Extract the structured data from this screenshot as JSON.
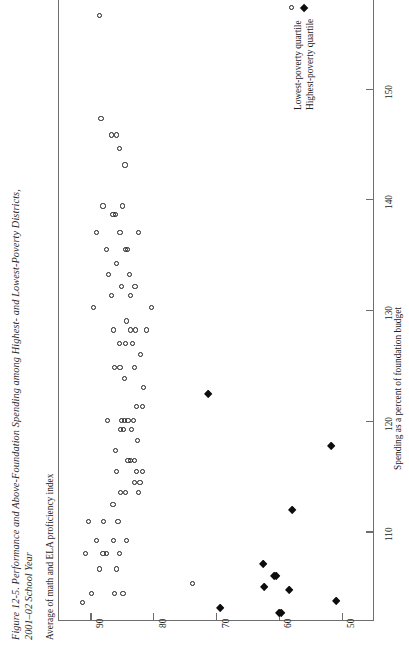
{
  "figure": {
    "title_line1": "Figure 12-5.  Performance and Above-Foundation Spending among Highest- and Lowest-Poverty Districts,",
    "title_line2": "2001–02 School Year"
  },
  "legend": {
    "position": "top-right",
    "items": [
      {
        "marker": "open-circle-marker",
        "label": "Lowest-poverty quartile"
      },
      {
        "marker": "filled-diamond-marker",
        "label": "Highest-poverty quartile"
      }
    ]
  },
  "chart_data": {
    "type": "scatter",
    "title": "Figure 12-5.  Performance and Above-Foundation Spending among Highest- and Lowest-Poverty Districts, 2001–02 School Year",
    "orientation": "rotated-90-ccw",
    "xlabel": "Spending as a percent of foundation budget",
    "ylabel": "Average of math and ELA proficiency index",
    "xlim": [
      102,
      158
    ],
    "ylim": [
      45,
      95
    ],
    "xticks": [
      110,
      120,
      130,
      140,
      150
    ],
    "yticks": [
      90,
      80,
      70,
      60,
      50
    ],
    "grid": false,
    "series": [
      {
        "name": "Lowest-poverty quartile",
        "marker": "open-circle",
        "points": [
          [
            156.6,
            88.5
          ],
          [
            147.3,
            88.3
          ],
          [
            145.8,
            86.6
          ],
          [
            145.8,
            85.9
          ],
          [
            144.6,
            85.4
          ],
          [
            143.1,
            84.5
          ],
          [
            139.4,
            88.0
          ],
          [
            139.4,
            84.9
          ],
          [
            138.6,
            86.4
          ],
          [
            138.6,
            86.0
          ],
          [
            137.0,
            89.0
          ],
          [
            137.0,
            85.3
          ],
          [
            137.0,
            82.3
          ],
          [
            135.5,
            87.5
          ],
          [
            135.5,
            84.4
          ],
          [
            135.5,
            84.1
          ],
          [
            134.2,
            85.8
          ],
          [
            133.2,
            87.1
          ],
          [
            133.2,
            83.8
          ],
          [
            132.1,
            85.0
          ],
          [
            132.1,
            82.9
          ],
          [
            131.3,
            86.7
          ],
          [
            131.3,
            83.6
          ],
          [
            130.2,
            89.5
          ],
          [
            130.2,
            80.3
          ],
          [
            129.0,
            84.2
          ],
          [
            128.2,
            86.3
          ],
          [
            128.2,
            83.6
          ],
          [
            128.2,
            82.8
          ],
          [
            128.2,
            81.1
          ],
          [
            127.0,
            85.4
          ],
          [
            127.0,
            84.4
          ],
          [
            127.0,
            83.3
          ],
          [
            126.0,
            82.0
          ],
          [
            124.8,
            86.1
          ],
          [
            124.8,
            85.3
          ],
          [
            124.8,
            83.0
          ],
          [
            123.8,
            84.6
          ],
          [
            123.0,
            81.5
          ],
          [
            121.3,
            82.6
          ],
          [
            121.3,
            81.7
          ],
          [
            120.0,
            87.3
          ],
          [
            120.0,
            85.0
          ],
          [
            120.0,
            84.6
          ],
          [
            120.0,
            84.0
          ],
          [
            120.0,
            83.2
          ],
          [
            119.2,
            85.2
          ],
          [
            119.2,
            84.7
          ],
          [
            119.2,
            83.5
          ],
          [
            118.2,
            82.5
          ],
          [
            117.3,
            86.0
          ],
          [
            116.4,
            84.0
          ],
          [
            116.4,
            83.6
          ],
          [
            116.4,
            83.0
          ],
          [
            115.4,
            85.8
          ],
          [
            115.4,
            82.6
          ],
          [
            115.4,
            81.7
          ],
          [
            114.4,
            83.0
          ],
          [
            114.4,
            82.1
          ],
          [
            113.5,
            85.2
          ],
          [
            113.5,
            84.4
          ],
          [
            113.5,
            82.4
          ],
          [
            112.4,
            86.4
          ],
          [
            110.9,
            90.3
          ],
          [
            110.9,
            87.9
          ],
          [
            110.9,
            85.6
          ],
          [
            109.2,
            89.0
          ],
          [
            109.2,
            86.3
          ],
          [
            109.2,
            84.2
          ],
          [
            108.0,
            90.8
          ],
          [
            108.0,
            88.0
          ],
          [
            108.0,
            87.4
          ],
          [
            108.0,
            85.4
          ],
          [
            106.6,
            88.6
          ],
          [
            106.6,
            85.9
          ],
          [
            105.3,
            73.7
          ],
          [
            104.4,
            89.8
          ],
          [
            104.4,
            86.2
          ],
          [
            104.4,
            84.8
          ],
          [
            103.6,
            91.3
          ]
        ]
      },
      {
        "name": "Highest-poverty quartile",
        "marker": "filled-diamond",
        "points": [
          [
            122.4,
            71.3
          ],
          [
            117.7,
            51.6
          ],
          [
            111.9,
            57.8
          ],
          [
            107.0,
            62.5
          ],
          [
            106.0,
            60.8
          ],
          [
            106.0,
            60.4
          ],
          [
            105.0,
            62.4
          ],
          [
            104.7,
            58.4
          ],
          [
            103.7,
            50.8
          ],
          [
            103.1,
            69.4
          ],
          [
            102.6,
            59.9
          ],
          [
            102.6,
            59.6
          ]
        ]
      }
    ]
  }
}
